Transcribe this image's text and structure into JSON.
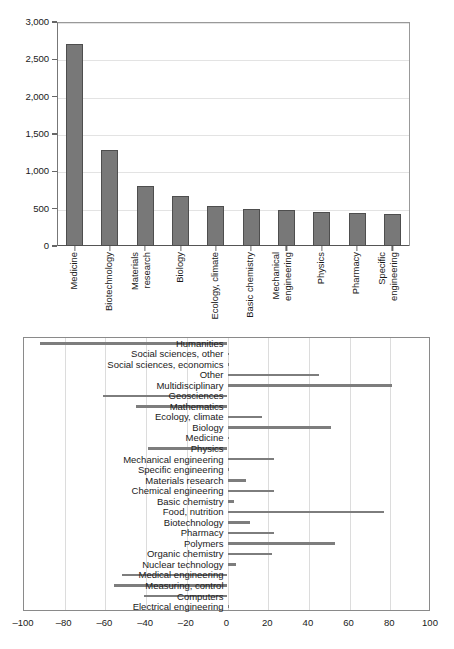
{
  "chart_data": [
    {
      "type": "bar",
      "title": "",
      "xlabel": "",
      "ylabel": "",
      "ylim": [
        0,
        3000
      ],
      "grid": true,
      "legend": "none",
      "orientation": "vertical",
      "bar_color": "#787878",
      "ytick_labels": [
        "0",
        "500",
        "1,000",
        "1,500",
        "2,000",
        "2,500",
        "3,000"
      ],
      "ytick_values": [
        0,
        500,
        1000,
        1500,
        2000,
        2500,
        3000
      ],
      "categories": [
        "Medicine",
        "Biotechnology",
        "Materials research",
        "Biology",
        "Ecology, climate",
        "Basic chemistry",
        "Mechanical engineering",
        "Physics",
        "Pharmacy",
        "Specific engineering"
      ],
      "category_lines": [
        [
          "Medicine"
        ],
        [
          "Biotechnology"
        ],
        [
          "Materials",
          "research"
        ],
        [
          "Biology"
        ],
        [
          "Ecology, climate"
        ],
        [
          "Basic chemistry"
        ],
        [
          "Mechanical",
          "engineering"
        ],
        [
          "Physics"
        ],
        [
          "Pharmacy"
        ],
        [
          "Specific",
          "engineering"
        ]
      ],
      "values": [
        2700,
        1290,
        800,
        665,
        535,
        490,
        488,
        462,
        440,
        432
      ]
    },
    {
      "type": "bar",
      "title": "",
      "xlabel": "",
      "ylabel": "",
      "xlim": [
        -100,
        100
      ],
      "grid": true,
      "legend": "none",
      "orientation": "horizontal",
      "bar_color": "#7d7d7d",
      "xtick_labels": [
        "–100",
        "–80",
        "–60",
        "–40",
        "–20",
        "0",
        "20",
        "40",
        "60",
        "80",
        "100"
      ],
      "xtick_values": [
        -100,
        -80,
        -60,
        -40,
        -20,
        0,
        20,
        40,
        60,
        80,
        100
      ],
      "categories": [
        "Humanities",
        "Social sciences, other",
        "Social sciences, economics",
        "Other",
        "Multidisciplinary",
        "Geosciences",
        "Mathematics",
        "Ecology, climate",
        "Biology",
        "Medicine",
        "Physics",
        "Mechanical engineering",
        "Specific engineering",
        "Materials research",
        "Chemical engineering",
        "Basic chemistry",
        "Food, nutrition",
        "Biotechnology",
        "Pharmacy",
        "Polymers",
        "Organic chemistry",
        "Nuclear technology",
        "Medical engineering",
        "Measuring, control",
        "Computers",
        "Electrical engineering"
      ],
      "values": [
        -92,
        0,
        0,
        45,
        81,
        -61,
        -45,
        17,
        51,
        0,
        -39,
        23,
        0,
        9,
        23,
        3,
        77,
        11,
        23,
        53,
        22,
        4,
        -52,
        -56,
        -41,
        0
      ]
    }
  ]
}
